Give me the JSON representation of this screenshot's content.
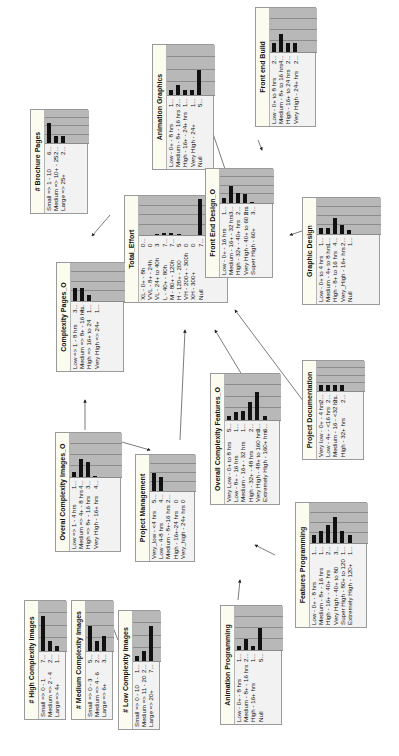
{
  "edges_note": "arrows between nodes",
  "nodes": [
    {
      "id": "total_effort",
      "title": "Total_Effort",
      "x": 124,
      "y": 303,
      "w": 108,
      "h": 104,
      "labelw": 55,
      "states": [
        [
          "XL - 0+ - 8h",
          "0..."
        ],
        [
          "VVL - 8+ - 24h",
          "0"
        ],
        [
          "VL - 24+ to 40h",
          "3"
        ],
        [
          "L - 40+ - 80h",
          "7..."
        ],
        [
          "M - 80+ - 120h",
          "7..."
        ],
        [
          "H - 120+ - 200",
          "5"
        ],
        [
          "VH - 200+ - 300h",
          "0"
        ],
        [
          "XH - 300+",
          "0"
        ],
        [
          "Null",
          "7..."
        ]
      ],
      "bars": [
        0,
        0,
        0.02,
        0.05,
        0.05,
        0.03,
        0,
        0,
        0.92
      ]
    },
    {
      "id": "front_end_build",
      "title": "Front end Build",
      "x": 255,
      "y": 127,
      "w": 120,
      "h": 61,
      "labelw": 62,
      "states": [
        [
          "Low - 0+ to 8 hrs",
          "2..."
        ],
        [
          "Medium - 8+ to 16 hrs",
          "4..."
        ],
        [
          "High - 16+ to 24 hrs",
          "2..."
        ],
        [
          "Very High - 24+ hrs",
          "2..."
        ]
      ],
      "bars": [
        0.2,
        0.4,
        0.2,
        0.2
      ]
    },
    {
      "id": "animation_graphics",
      "title": "Animation Graphics",
      "x": 152,
      "y": 170,
      "w": 126,
      "h": 62,
      "labelw": 62,
      "states": [
        [
          "Low - 0+ - 8 hrs",
          "1..."
        ],
        [
          "Medium - 8+ - 16 hrs",
          "2..."
        ],
        [
          "High - 16+ - 24+ hrs",
          "1..."
        ],
        [
          "Very High - 24+",
          "1..."
        ],
        [
          "Null",
          "5..."
        ]
      ],
      "bars": [
        0.1,
        0.2,
        0.1,
        0.1,
        0.5
      ]
    },
    {
      "id": "front_end_design",
      "title": "Front End Design_O",
      "x": 205,
      "y": 278,
      "w": 110,
      "h": 68,
      "labelw": 62,
      "states": [
        [
          "Low - 0+ - 16 hrs",
          "1..."
        ],
        [
          "Medium - 16+ - 32 hrs",
          "3..."
        ],
        [
          "High - 32+ - 40+ hrs",
          "2..."
        ],
        [
          "Very High - 40+ to 60 hrs",
          "2..."
        ],
        [
          "Super High - 60+",
          "3..."
        ]
      ],
      "bars": [
        0.15,
        0.5,
        0.3,
        0.25,
        0.03
      ]
    },
    {
      "id": "graphic_design",
      "title": "Graphic Design",
      "x": 302,
      "y": 305,
      "w": 108,
      "h": 78,
      "labelw": 58,
      "states": [
        [
          "Low - 0+ to 4 hrs",
          "1..."
        ],
        [
          "Medium - 4+ to 8 hrs",
          "1..."
        ],
        [
          "High - 8+ to 16 hrs",
          "4..."
        ],
        [
          "Very_High - 16+ hrs",
          "2..."
        ],
        [
          "Null",
          "1..."
        ]
      ],
      "bars": [
        0.18,
        0.18,
        0.45,
        0.25,
        0.1
      ]
    },
    {
      "id": "brochure_pages",
      "title": "# Brochure Pages",
      "x": 30,
      "y": 214,
      "w": 105,
      "h": 58,
      "labelw": 58,
      "states": [
        [
          "Small => 1 - 10",
          "6..."
        ],
        [
          "Medium => 10+ - 25",
          "2..."
        ],
        [
          "Large => 25+",
          "2..."
        ]
      ],
      "bars": [
        0.6,
        0.2,
        0.2
      ]
    },
    {
      "id": "complexity_pages",
      "title": "Complexity Pages_O",
      "x": 56,
      "y": 372,
      "w": 110,
      "h": 68,
      "labelw": 58,
      "states": [
        [
          "Low => 1 - 8 hrs",
          "3..."
        ],
        [
          "Medium => 8+ - 16 hrs",
          "4..."
        ],
        [
          "High => 16+ to 24",
          "1..."
        ],
        [
          "Very High => 24+",
          "1..."
        ]
      ],
      "bars": [
        0.35,
        0.35,
        0.15,
        0
      ]
    },
    {
      "id": "overall_complexity_images",
      "title": "Overal Complexity Images_O",
      "x": 55,
      "y": 552,
      "w": 120,
      "h": 66,
      "labelw": 62,
      "states": [
        [
          "Low => 1 - 4 hrs",
          "1..."
        ],
        [
          "Medium => 4+ - 8 hrs",
          "4..."
        ],
        [
          "High => 8+ - 16 hrs",
          "3..."
        ],
        [
          "Very High - 16+ hrs",
          "4..."
        ]
      ],
      "bars": [
        0.12,
        0.4,
        0.35,
        0.03
      ]
    },
    {
      "id": "project_management",
      "title": "Project Management",
      "x": 135,
      "y": 562,
      "w": 108,
      "h": 60,
      "labelw": 58,
      "states": [
        [
          "Very_low - <4 hrs",
          "5..."
        ],
        [
          "Low - 4-8 hrs",
          "4..."
        ],
        [
          "Medium - 8+-16 hrs",
          "2..."
        ],
        [
          "High - 16+-24 hrs",
          "0"
        ],
        [
          "Very_high - 24+ hrs",
          "0"
        ]
      ],
      "bars": [
        0.5,
        0.4,
        0,
        0,
        0
      ]
    },
    {
      "id": "overall_complexity_features",
      "title": "Overall Complexity Features_O",
      "x": 210,
      "y": 505,
      "w": 132,
      "h": 70,
      "labelw": 72,
      "states": [
        [
          "Very Low - 0+ to 8 hrs",
          "5..."
        ],
        [
          "Low - 8+ - 16 hrs",
          "1..."
        ],
        [
          "Medium - 16+ - 32 hrs",
          "1..."
        ],
        [
          "High - 32+ - 48 hrs",
          "2..."
        ],
        [
          "Very High - 48+ to 160 hrs",
          "3..."
        ],
        [
          "Extremely High - 160+ hrs",
          "6..."
        ]
      ],
      "bars": [
        0.08,
        0.18,
        0.2,
        0.4,
        0.6,
        0.08
      ]
    },
    {
      "id": "project_documentation",
      "title": "Project Documentation",
      "x": 302,
      "y": 460,
      "w": 100,
      "h": 62,
      "labelw": 56,
      "states": [
        [
          "Very low - 0+ - 4 hrs",
          "2..."
        ],
        [
          "Low - 4+ - <16 hrs",
          "2..."
        ],
        [
          "Medium - 16 - <32 hrs",
          "2..."
        ],
        [
          "High - 32+ hrs",
          "2..."
        ]
      ],
      "bars": [
        0.2,
        0.2,
        0.2,
        0.2
      ]
    },
    {
      "id": "features_programming",
      "title": "Features Programming",
      "x": 295,
      "y": 628,
      "w": 126,
      "h": 72,
      "labelw": 72,
      "states": [
        [
          "Low - 0+ - 8 hrs",
          "1..."
        ],
        [
          "Medium - 8+ - 16 hrs",
          "1..."
        ],
        [
          "High - 16+ - 40+ hrs",
          "2..."
        ],
        [
          "Very High - 40+ to 80",
          "3..."
        ],
        [
          "Super High - 80+ to 120",
          "1..."
        ],
        [
          "Extremely High - 120+",
          "1..."
        ]
      ],
      "bars": [
        0.2,
        0.3,
        0.45,
        0.65,
        0.3,
        0.2
      ]
    },
    {
      "id": "animation_programming",
      "title": "Animation Programming",
      "x": 220,
      "y": 725,
      "w": 120,
      "h": 62,
      "labelw": 62,
      "states": [
        [
          "Low - 0+ - 8 hrs",
          "1..."
        ],
        [
          "Medium - 8+ - 16 hrs",
          "2..."
        ],
        [
          "High - 16+ hrs",
          "1..."
        ],
        [
          "Null",
          "5..."
        ]
      ],
      "bars": [
        0.1,
        0.25,
        0.1,
        0.5
      ]
    },
    {
      "id": "high_complexity_images",
      "title": "# High Complexity Images",
      "x": 24,
      "y": 720,
      "w": 120,
      "h": 42,
      "labelw": 56,
      "states": [
        [
          "Small => 0 - 1",
          "7..."
        ],
        [
          "Medium => 2 - 4",
          "2..."
        ],
        [
          "Large => 4+",
          "1..."
        ]
      ],
      "bars": [
        0.7,
        0.2,
        0.1
      ]
    },
    {
      "id": "medium_complexity_images",
      "title": "# Medium Complexity Images",
      "x": 71,
      "y": 720,
      "w": 120,
      "h": 42,
      "labelw": 56,
      "states": [
        [
          "Small => 0 - 3",
          "5..."
        ],
        [
          "Medium => 4 - 6",
          "2..."
        ],
        [
          "Large => 6+",
          "3..."
        ]
      ],
      "bars": [
        0.5,
        0.2,
        0.3
      ]
    },
    {
      "id": "low_complexity_images",
      "title": "# Low Complexity Images",
      "x": 118,
      "y": 730,
      "w": 120,
      "h": 42,
      "labelw": 56,
      "states": [
        [
          "Small => 0 - 10",
          "1..."
        ],
        [
          "Medium => 11 - 20",
          "2..."
        ],
        [
          "Large => 20+",
          "7..."
        ]
      ],
      "bars": [
        0.1,
        0.2,
        0.7
      ]
    }
  ],
  "edges": [
    [
      258,
      140,
      262,
      150
    ],
    [
      205,
      110,
      226,
      172
    ],
    [
      305,
      230,
      290,
      235
    ],
    [
      250,
      245,
      235,
      250
    ],
    [
      110,
      215,
      92,
      236
    ],
    [
      92,
      300,
      128,
      292
    ],
    [
      97,
      435,
      150,
      450
    ],
    [
      85,
      430,
      85,
      400
    ],
    [
      180,
      440,
      185,
      330
    ],
    [
      245,
      380,
      215,
      330
    ],
    [
      310,
      410,
      235,
      310
    ],
    [
      275,
      555,
      255,
      545
    ],
    [
      238,
      600,
      240,
      580
    ],
    [
      55,
      625,
      60,
      615
    ],
    [
      88,
      625,
      88,
      615
    ],
    [
      118,
      640,
      108,
      615
    ]
  ]
}
